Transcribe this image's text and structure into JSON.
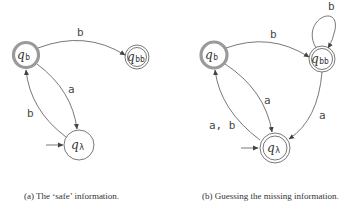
{
  "figure_a": {
    "caption": "(a) The ‘safe’ information.",
    "states": {
      "qb": {
        "name": "q",
        "sub": "b"
      },
      "qbb": {
        "name": "q",
        "sub": "bb"
      },
      "ql": {
        "name": "q",
        "sub": "λ"
      }
    },
    "edges": {
      "qb_qbb": "b",
      "qb_ql": "a",
      "ql_qb": "b"
    }
  },
  "figure_b": {
    "caption": "(b) Guessing the missing information.",
    "states": {
      "qb": {
        "name": "q",
        "sub": "b"
      },
      "qbb": {
        "name": "q",
        "sub": "bb"
      },
      "ql": {
        "name": "q",
        "sub": "λ"
      }
    },
    "edges": {
      "qb_qbb": "b",
      "qbb_loop": "b",
      "qb_ql": "a",
      "ql_qb": "a, b",
      "qbb_ql": "a"
    }
  },
  "colors": {
    "highlight_ring": "#9a9a9a",
    "stroke": "#555555"
  }
}
